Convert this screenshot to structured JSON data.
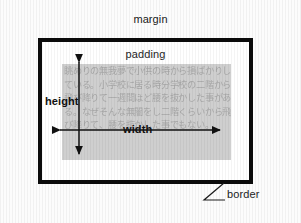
{
  "diagram": {
    "colors": {
      "page_background": "#fcfcfc",
      "border_color": "#0b0b0b",
      "padding_background": "#ffffff",
      "content_background": "#cfcfcf",
      "content_text_color": "#a8a8a8",
      "label_color": "#1c1c1c",
      "arrow_color": "#111111"
    },
    "labels": {
      "margin": "margin",
      "padding": "padding",
      "height": "height",
      "width": "width",
      "border": "border"
    },
    "content": {
      "text": "眺めりの無我夢で小供の時から損ばかりしている。小学校に居る時分学校の二階から飛び降りて一週間ほど腰を抜かした事がある。なぜそんな無闇をし二階くらいから飛び降りて、腰を抜かした事でもない。"
    },
    "arrows": {
      "height_arrow": {
        "orientation": "vertical",
        "label": "height",
        "x": 79,
        "y_top": 60,
        "y_bottom": 156
      },
      "width_arrow": {
        "orientation": "horizontal",
        "label": "width",
        "y": 130,
        "x_left": 58,
        "x_right": 222
      }
    },
    "callout": {
      "label": "border",
      "leader_from": [
        200,
        200
      ],
      "leader_to": [
        224,
        183
      ]
    },
    "box_metrics": {
      "border_box": {
        "left": 38,
        "top": 38,
        "width": 215,
        "height": 146,
        "border_width": 4
      },
      "content_box": {
        "left": 62,
        "top": 64,
        "width": 169,
        "height": 96
      }
    }
  }
}
